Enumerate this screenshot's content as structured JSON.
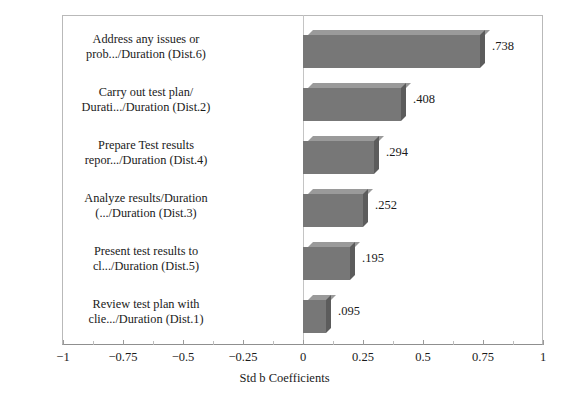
{
  "chart_data": {
    "type": "bar",
    "orientation": "horizontal",
    "title": "",
    "xlabel": "Std b Coefficients",
    "ylabel": "",
    "xlim": [
      -1,
      1
    ],
    "grid": false,
    "legend": null,
    "bar_color": "#777777",
    "bar_top_color": "#9a9a9a",
    "bar_side_color": "#5c5c5c",
    "xticks": [
      "-1",
      "-0.75",
      "-0.5",
      "-0.25",
      "0",
      "0.25",
      "0.5",
      "0.75",
      "1"
    ],
    "xtick_values": [
      -1,
      -0.75,
      -0.5,
      -0.25,
      0,
      0.25,
      0.5,
      0.75,
      1
    ],
    "minor_tick_interval": 0.125,
    "categories": [
      "Address any issues or prob.../Duration (Dist.6)",
      "Carry out test plan/ Durati.../Duration (Dist.2)",
      "Prepare Test results repor.../Duration (Dist.4)",
      "Analyze results/Duration (.../Duration (Dist.3)",
      "Present test results to cl.../Duration (Dist.5)",
      "Review test plan with clie.../Duration (Dist.1)"
    ],
    "values": [
      0.738,
      0.408,
      0.294,
      0.252,
      0.195,
      0.095
    ],
    "value_labels": [
      ".738",
      ".408",
      ".294",
      ".252",
      ".195",
      ".095"
    ],
    "bars": [
      {
        "label_line1": "Address any issues or",
        "label_line2": "prob.../Duration (Dist.6)",
        "value": 0.738,
        "value_label": ".738"
      },
      {
        "label_line1": "Carry out test plan/",
        "label_line2": "Durati.../Duration (Dist.2)",
        "value": 0.408,
        "value_label": ".408"
      },
      {
        "label_line1": "Prepare Test results",
        "label_line2": "repor.../Duration (Dist.4)",
        "value": 0.294,
        "value_label": ".294"
      },
      {
        "label_line1": "Analyze results/Duration",
        "label_line2": "(.../Duration (Dist.3)",
        "value": 0.252,
        "value_label": ".252"
      },
      {
        "label_line1": "Present test results to",
        "label_line2": "cl.../Duration (Dist.5)",
        "value": 0.195,
        "value_label": ".195"
      },
      {
        "label_line1": "Review test plan with",
        "label_line2": "clie.../Duration (Dist.1)",
        "value": 0.095,
        "value_label": ".095"
      }
    ]
  }
}
